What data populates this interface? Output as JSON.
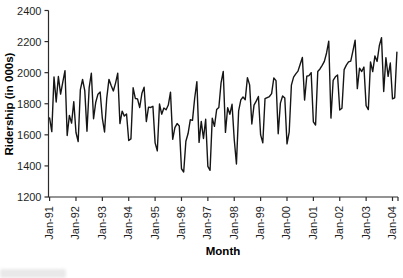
{
  "chart_data": {
    "type": "line",
    "title": "",
    "xlabel": "Month",
    "ylabel": "Ridership (in 000s)",
    "ylim": [
      1200,
      2400
    ],
    "yticks": [
      2400,
      2200,
      2000,
      1800,
      1600,
      1400,
      1200
    ],
    "xtick_labels": [
      "Jan-91",
      "Jan-92",
      "Jan-93",
      "Jan-94",
      "Jan-95",
      "Jan-96",
      "Jan-97",
      "Jan-98",
      "Jan-99",
      "Jan-00",
      "Jan-01",
      "Jan-02",
      "Jan-03",
      "Jan-04"
    ],
    "grid": false,
    "legend": false,
    "line_color": "#151515",
    "axis_color": "#2b2b2b",
    "x": [
      "Jan-91",
      "Feb-91",
      "Mar-91",
      "Apr-91",
      "May-91",
      "Jun-91",
      "Jul-91",
      "Aug-91",
      "Sep-91",
      "Oct-91",
      "Nov-91",
      "Dec-91",
      "Jan-92",
      "Feb-92",
      "Mar-92",
      "Apr-92",
      "May-92",
      "Jun-92",
      "Jul-92",
      "Aug-92",
      "Sep-92",
      "Oct-92",
      "Nov-92",
      "Dec-92",
      "Jan-93",
      "Feb-93",
      "Mar-93",
      "Apr-93",
      "May-93",
      "Jun-93",
      "Jul-93",
      "Aug-93",
      "Sep-93",
      "Oct-93",
      "Nov-93",
      "Dec-93",
      "Jan-94",
      "Feb-94",
      "Mar-94",
      "Apr-94",
      "May-94",
      "Jun-94",
      "Jul-94",
      "Aug-94",
      "Sep-94",
      "Oct-94",
      "Nov-94",
      "Dec-94",
      "Jan-95",
      "Feb-95",
      "Mar-95",
      "Apr-95",
      "May-95",
      "Jun-95",
      "Jul-95",
      "Aug-95",
      "Sep-95",
      "Oct-95",
      "Nov-95",
      "Dec-95",
      "Jan-96",
      "Feb-96",
      "Mar-96",
      "Apr-96",
      "May-96",
      "Jun-96",
      "Jul-96",
      "Aug-96",
      "Sep-96",
      "Oct-96",
      "Nov-96",
      "Dec-96",
      "Jan-97",
      "Feb-97",
      "Mar-97",
      "Apr-97",
      "May-97",
      "Jun-97",
      "Jul-97",
      "Aug-97",
      "Sep-97",
      "Oct-97",
      "Nov-97",
      "Dec-97",
      "Jan-98",
      "Feb-98",
      "Mar-98",
      "Apr-98",
      "May-98",
      "Jun-98",
      "Jul-98",
      "Aug-98",
      "Sep-98",
      "Oct-98",
      "Nov-98",
      "Dec-98",
      "Jan-99",
      "Feb-99",
      "Mar-99",
      "Apr-99",
      "May-99",
      "Jun-99",
      "Jul-99",
      "Aug-99",
      "Sep-99",
      "Oct-99",
      "Nov-99",
      "Dec-99",
      "Jan-00",
      "Feb-00",
      "Mar-00",
      "Apr-00",
      "May-00",
      "Jun-00",
      "Jul-00",
      "Aug-00",
      "Sep-00",
      "Oct-00",
      "Nov-00",
      "Dec-00",
      "Jan-01",
      "Feb-01",
      "Mar-01",
      "Apr-01",
      "May-01",
      "Jun-01",
      "Jul-01",
      "Aug-01",
      "Sep-01",
      "Oct-01",
      "Nov-01",
      "Dec-01",
      "Jan-02",
      "Feb-02",
      "Mar-02",
      "Apr-02",
      "May-02",
      "Jun-02",
      "Jul-02",
      "Aug-02",
      "Sep-02",
      "Oct-02",
      "Nov-02",
      "Dec-02",
      "Jan-03",
      "Feb-03",
      "Mar-03",
      "Apr-03",
      "May-03",
      "Jun-03",
      "Jul-03",
      "Aug-03",
      "Sep-03",
      "Oct-03",
      "Nov-03",
      "Dec-03",
      "Jan-04",
      "Feb-04",
      "Mar-04"
    ],
    "values": [
      1708.9,
      1620.6,
      1972.7,
      1811.7,
      1975.0,
      1862.4,
      1939.9,
      2013.3,
      1595.7,
      1724.9,
      1675.7,
      1813.9,
      1614.8,
      1557.1,
      1891.2,
      1956.0,
      1884.7,
      1623.0,
      1903.3,
      1996.7,
      1703.9,
      1810.0,
      1861.6,
      1875.1,
      1705.3,
      1618.5,
      1836.7,
      1957.0,
      1917.2,
      1882.4,
      1933.0,
      1996.2,
      1672.8,
      1752.8,
      1720.4,
      1734.3,
      1563.4,
      1574.0,
      1902.6,
      1833.9,
      1831.0,
      1775.8,
      1867.2,
      1906.6,
      1685.6,
      1778.5,
      1776.0,
      1783.4,
      1548.4,
      1496.9,
      1798.3,
      1732.9,
      1772.3,
      1761.2,
      1791.7,
      1874.8,
      1571.3,
      1646.9,
      1672.6,
      1656.8,
      1381.8,
      1360.9,
      1558.6,
      1608.4,
      1696.7,
      1693.2,
      1835.5,
      1942.6,
      1551.4,
      1686.5,
      1576.2,
      1700.4,
      1396.6,
      1371.7,
      1707.5,
      1654.6,
      1762.9,
      1775.8,
      1934.2,
      2008.1,
      1615.9,
      1773.9,
      1732.4,
      1796.6,
      1570.3,
      1412.7,
      1754.6,
      1824.9,
      1843.3,
      1826.0,
      1968.2,
      1921.6,
      1669.6,
      1791.5,
      1816.7,
      1846.8,
      1599.4,
      1548.8,
      1832.3,
      1839.7,
      1846.5,
      1864.9,
      1965.7,
      1949.0,
      1607.4,
      1803.7,
      1850.3,
      1836.4,
      1541.7,
      1616.9,
      1919.5,
      1971.5,
      1992.3,
      2009.8,
      2054.0,
      2097.5,
      1823.7,
      1977.0,
      1981.4,
      2000.2,
      1683.1,
      1663.4,
      2007.9,
      2023.8,
      2047.0,
      2072.9,
      2126.7,
      2202.6,
      1707.7,
      1950.7,
      1973.6,
      1984.7,
      1759.6,
      1770.6,
      2019.9,
      2048.4,
      2068.8,
      2074.9,
      2140.1,
      2209.0,
      1897.3,
      2029.2,
      2007.5,
      2036.3,
      1787.1,
      1762.3,
      2069.5,
      2006.7,
      2107.8,
      2072.1,
      2173.1,
      2225.3,
      1878.8,
      2097.0,
      1976.0,
      2062.2,
      1831.5,
      1838.0,
      2132.4
    ]
  }
}
